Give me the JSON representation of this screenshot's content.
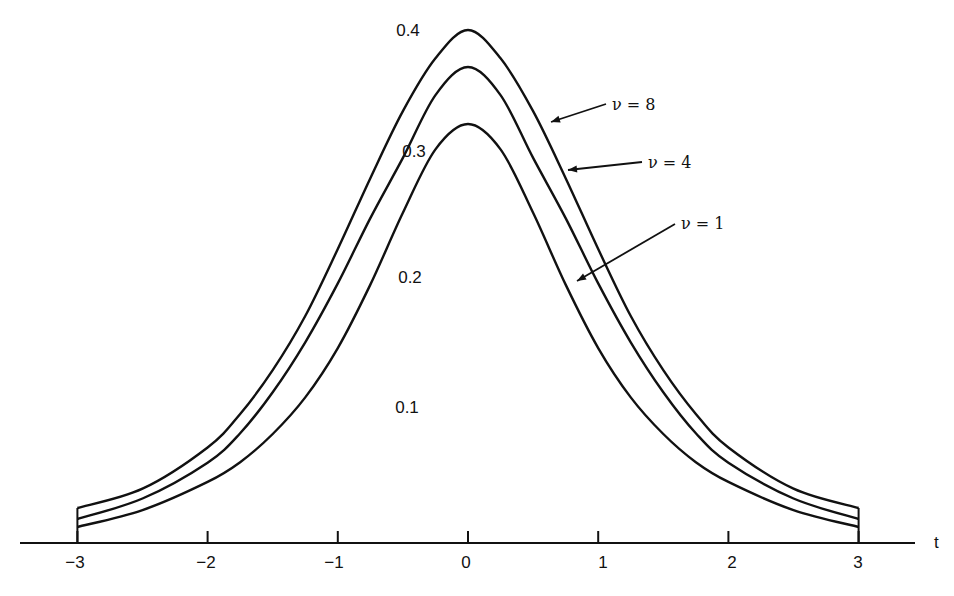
{
  "chart_data": {
    "type": "line",
    "title": "",
    "xlabel": "t",
    "ylabel": "",
    "xlim": [
      -3,
      3
    ],
    "ylim": [
      0,
      0.4
    ],
    "grid": false,
    "legend": "inline arrows pointing to curves",
    "x_ticks": [
      -3,
      -2,
      -1,
      0,
      1,
      2,
      3
    ],
    "x_tick_labels": [
      "−3",
      "−2",
      "−1",
      "0",
      "1",
      "2",
      "3"
    ],
    "y_tick_labels": [
      "0.4",
      "0.3",
      "0.2",
      "0.1"
    ],
    "y_ticks": [
      0.4,
      0.3,
      0.2,
      0.1
    ],
    "x": [
      -3,
      -2.5,
      -2,
      -1.75,
      -1.5,
      -1.25,
      -1,
      -0.75,
      -0.5,
      -0.25,
      0,
      0.25,
      0.5,
      0.75,
      1,
      1.25,
      1.5,
      1.75,
      2,
      2.5,
      3
    ],
    "series": [
      {
        "name": "ν = 8",
        "values": [
          0.017,
          0.032,
          0.064,
          0.09,
          0.124,
          0.166,
          0.218,
          0.273,
          0.325,
          0.366,
          0.388,
          0.366,
          0.325,
          0.273,
          0.218,
          0.166,
          0.124,
          0.09,
          0.064,
          0.032,
          0.017
        ]
      },
      {
        "name": "ν = 4",
        "values": [
          0.022,
          0.038,
          0.066,
          0.089,
          0.121,
          0.16,
          0.206,
          0.257,
          0.304,
          0.353,
          0.375,
          0.353,
          0.304,
          0.257,
          0.206,
          0.16,
          0.121,
          0.089,
          0.066,
          0.038,
          0.022
        ]
      },
      {
        "name": "ν = 1",
        "values": [
          0.032,
          0.044,
          0.064,
          0.078,
          0.098,
          0.124,
          0.159,
          0.204,
          0.255,
          0.3,
          0.318,
          0.3,
          0.255,
          0.204,
          0.159,
          0.124,
          0.098,
          0.078,
          0.064,
          0.044,
          0.032
        ]
      }
    ],
    "annotations": [
      {
        "text": "ν = 8",
        "points_to": "ν = 8 curve, right flank near t≈0.65"
      },
      {
        "text": "ν = 4",
        "points_to": "ν = 4 curve, right flank near t≈0.75"
      },
      {
        "text": "ν = 1",
        "points_to": "ν = 1 curve, right flank near t≈0.8"
      }
    ]
  },
  "render": {
    "axis_y_px": 543,
    "x0_px": 468,
    "px_per_t": 130.2,
    "series_px": [
      {
        "peak_y": 30,
        "tail_y": 508
      },
      {
        "peak_y": 67,
        "tail_y": 519
      },
      {
        "peak_y": 124,
        "tail_y": 527
      }
    ],
    "ink": "#111111"
  }
}
